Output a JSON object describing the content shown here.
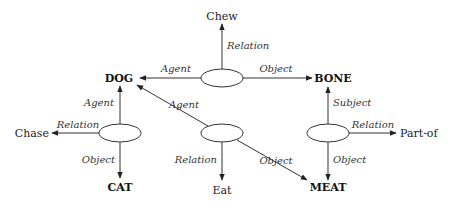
{
  "diagram": {
    "type": "semantic-network",
    "concepts": {
      "dog": "DOG",
      "bone": "BONE",
      "cat": "CAT",
      "meat": "MEAT"
    },
    "relations": {
      "chew": "Chew",
      "chase": "Chase",
      "eat": "Eat",
      "part_of": "Part-of"
    },
    "edge_labels": {
      "top_agent": "Agent",
      "top_object": "Object",
      "top_relation": "Relation",
      "left_agent": "Agent",
      "left_relation": "Relation",
      "left_object": "Object",
      "mid_agent": "Agent",
      "mid_relation": "Relation",
      "mid_object": "Object",
      "right_subject": "Subject",
      "right_relation": "Relation",
      "right_object": "Object"
    },
    "propositions": [
      {
        "node": "top",
        "agent": "DOG",
        "relation": "Chew",
        "object": "BONE"
      },
      {
        "node": "left",
        "agent": "DOG",
        "relation": "Chase",
        "object": "CAT"
      },
      {
        "node": "middle",
        "agent": "DOG",
        "relation": "Eat",
        "object": "MEAT"
      },
      {
        "node": "right",
        "subject": "BONE",
        "relation": "Part-of",
        "object": "MEAT"
      }
    ]
  }
}
